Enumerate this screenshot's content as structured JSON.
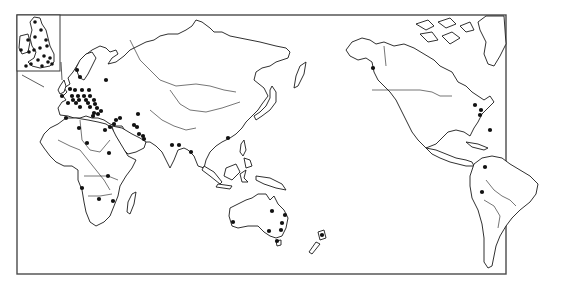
{
  "figure": {
    "type": "world-map",
    "projection": "Pacific-centered (Europe/Africa left, Americas right)",
    "frame": {
      "x": 17,
      "y": 15,
      "width": 489,
      "height": 259
    },
    "inset": {
      "label": "British Isles detail",
      "x": 17,
      "y": 15,
      "width": 43,
      "height": 56,
      "leader_to": [
        44,
        87
      ]
    },
    "colors": {
      "land_fill": "#ffffff",
      "outline": "#1a1a1a",
      "dot": "#111111",
      "frame": "#4a4a4a"
    },
    "marker_style": "filled black dot",
    "regions": [
      {
        "name": "british-isles-inset",
        "dot_count": 18
      },
      {
        "name": "europe",
        "dot_count": 28
      },
      {
        "name": "middle-east",
        "dot_count": 11
      },
      {
        "name": "africa",
        "dot_count": 7
      },
      {
        "name": "south-asia",
        "dot_count": 3
      },
      {
        "name": "east-asia",
        "dot_count": 1
      },
      {
        "name": "australia",
        "dot_count": 7
      },
      {
        "name": "new-zealand",
        "dot_count": 1
      },
      {
        "name": "north-america",
        "dot_count": 5
      },
      {
        "name": "south-america",
        "dot_count": 2
      }
    ]
  },
  "dots": {
    "inset": [
      [
        35,
        22
      ],
      [
        41,
        30
      ],
      [
        28,
        40
      ],
      [
        46,
        40
      ],
      [
        47,
        46
      ],
      [
        40,
        48
      ],
      [
        34,
        50
      ],
      [
        29,
        52
      ],
      [
        21,
        50
      ],
      [
        44,
        56
      ],
      [
        50,
        58
      ],
      [
        38,
        60
      ],
      [
        48,
        62
      ],
      [
        31,
        64
      ],
      [
        26,
        66
      ],
      [
        42,
        66
      ],
      [
        52,
        64
      ],
      [
        35,
        37
      ]
    ],
    "europe": [
      [
        77,
        70
      ],
      [
        80,
        77
      ],
      [
        106,
        80
      ],
      [
        70,
        89
      ],
      [
        75,
        90
      ],
      [
        82,
        90
      ],
      [
        89,
        90
      ],
      [
        62,
        96
      ],
      [
        72,
        96
      ],
      [
        78,
        96
      ],
      [
        84,
        96
      ],
      [
        90,
        96
      ],
      [
        73,
        100
      ],
      [
        79,
        100
      ],
      [
        86,
        100
      ],
      [
        94,
        100
      ],
      [
        68,
        103
      ],
      [
        76,
        103
      ],
      [
        88,
        103
      ],
      [
        95,
        104
      ],
      [
        80,
        107
      ],
      [
        90,
        107
      ],
      [
        97,
        108
      ],
      [
        101,
        111
      ],
      [
        94,
        113
      ],
      [
        98,
        114
      ],
      [
        66,
        118
      ],
      [
        93,
        116
      ]
    ],
    "middle_east": [
      [
        105,
        130
      ],
      [
        110,
        127
      ],
      [
        114,
        124
      ],
      [
        116,
        120
      ],
      [
        120,
        118
      ],
      [
        134,
        125
      ],
      [
        137,
        127
      ],
      [
        139,
        134
      ],
      [
        143,
        136
      ],
      [
        144,
        139
      ],
      [
        138,
        114
      ]
    ],
    "africa": [
      [
        79,
        128
      ],
      [
        87,
        143
      ],
      [
        109,
        153
      ],
      [
        108,
        176
      ],
      [
        82,
        188
      ],
      [
        99,
        199
      ],
      [
        113,
        201
      ]
    ],
    "south_asia": [
      [
        172,
        145
      ],
      [
        179,
        145
      ],
      [
        191,
        152
      ]
    ],
    "east_asia": [
      [
        228,
        138
      ]
    ],
    "australia": [
      [
        233,
        222
      ],
      [
        272,
        211
      ],
      [
        285,
        215
      ],
      [
        282,
        223
      ],
      [
        281,
        230
      ],
      [
        269,
        231
      ],
      [
        277,
        241
      ]
    ],
    "new_zealand": [
      [
        322,
        235
      ]
    ],
    "north_america": [
      [
        373,
        68
      ],
      [
        475,
        105
      ],
      [
        481,
        110
      ],
      [
        480,
        115
      ],
      [
        490,
        130
      ]
    ],
    "south_america": [
      [
        485,
        167
      ],
      [
        482,
        192
      ]
    ]
  }
}
